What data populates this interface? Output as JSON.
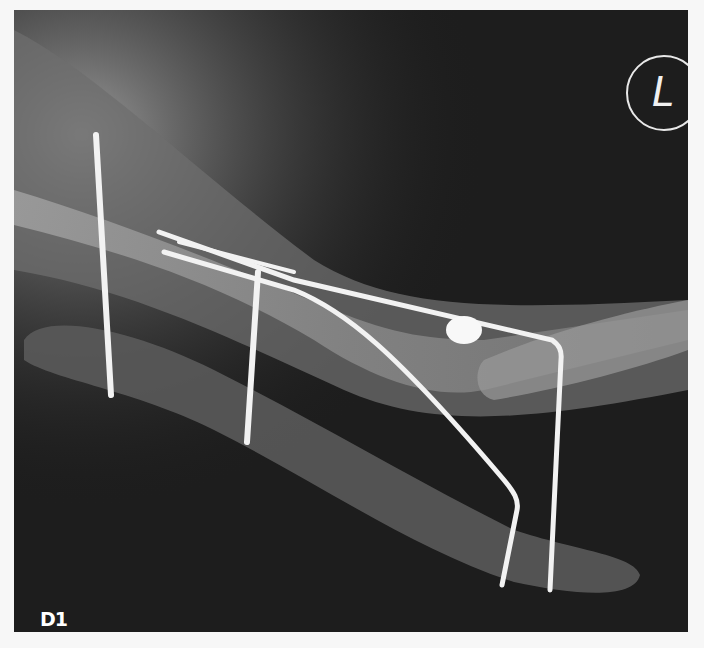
{
  "image": {
    "panel_label": "D1",
    "side_marker": "L",
    "colors": {
      "background": "#1d1d1d",
      "pin": "#f2f2f2",
      "bone": "#8a8a8a",
      "fixator_bar": "#5a5a5a",
      "page": "#f7f7f7"
    }
  }
}
